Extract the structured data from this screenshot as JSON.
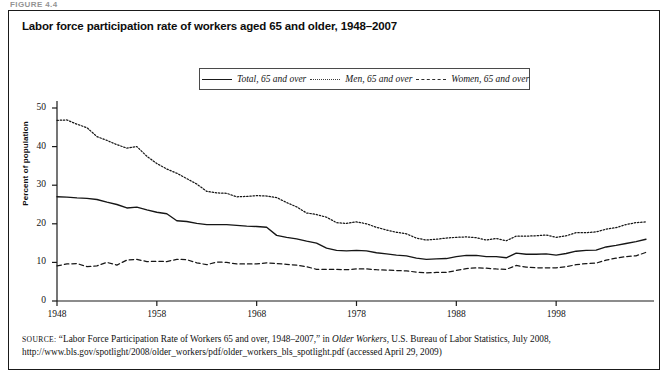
{
  "figure": {
    "label": "FIGURE 4.4",
    "title": "Labor force participation rate of workers aged 65 and older, 1948–2007"
  },
  "legend": {
    "position": "top-center",
    "items": [
      {
        "label": "Total, 65 and over",
        "style": "solid"
      },
      {
        "label": "Men, 65 and over",
        "style": "dotted"
      },
      {
        "label": "Women, 65 and over",
        "style": "dashed"
      }
    ]
  },
  "axes": {
    "ylabel": "Percent of population",
    "yticks": [
      "0",
      "10",
      "20",
      "30",
      "40",
      "50"
    ],
    "xticks": [
      "1948",
      "1958",
      "1968",
      "1978",
      "1988",
      "1998"
    ]
  },
  "source": {
    "kicker": "Source:",
    "text_before_italic": " “Labor Force Participation Rate of Workers 65 and over, 1948–2007,” in ",
    "italic_title": "Older Workers",
    "text_after_italic": ", U.S. Bureau of Labor Statistics, July 2008, http://www.bls.gov/spotlight/2008/older_workers/pdf/older_workers_bls_spotlight.pdf (accessed April 29, 2009)"
  },
  "chart_data": {
    "type": "line",
    "title": "Labor force participation rate of workers aged 65 and older, 1948–2007",
    "xlabel": "",
    "ylabel": "Percent of population",
    "xlim": [
      1948,
      2007
    ],
    "ylim": [
      0,
      50
    ],
    "grid": false,
    "legend_position": "top-center",
    "x": [
      1948,
      1949,
      1950,
      1951,
      1952,
      1953,
      1954,
      1955,
      1956,
      1957,
      1958,
      1959,
      1960,
      1961,
      1962,
      1963,
      1964,
      1965,
      1966,
      1967,
      1968,
      1969,
      1970,
      1971,
      1972,
      1973,
      1974,
      1975,
      1976,
      1977,
      1978,
      1979,
      1980,
      1981,
      1982,
      1983,
      1984,
      1985,
      1986,
      1987,
      1988,
      1989,
      1990,
      1991,
      1992,
      1993,
      1994,
      1995,
      1996,
      1997,
      1998,
      1999,
      2000,
      2001,
      2002,
      2003,
      2004,
      2005,
      2006,
      2007
    ],
    "series": [
      {
        "name": "Total, 65 and over",
        "style": "solid",
        "values": [
          27.0,
          26.9,
          26.7,
          26.6,
          26.3,
          25.6,
          25.0,
          24.1,
          24.3,
          23.6,
          23.0,
          22.6,
          20.8,
          20.6,
          20.1,
          19.8,
          19.8,
          19.8,
          19.6,
          19.4,
          19.3,
          19.1,
          17.0,
          16.5,
          16.1,
          15.5,
          15.0,
          13.7,
          13.1,
          13.0,
          13.1,
          13.0,
          12.5,
          12.2,
          11.9,
          11.7,
          11.1,
          10.8,
          10.9,
          11.0,
          11.5,
          11.8,
          11.8,
          11.5,
          11.5,
          11.2,
          12.4,
          12.1,
          12.1,
          12.2,
          11.9,
          12.3,
          12.9,
          13.1,
          13.2,
          14.0,
          14.4,
          14.9,
          15.4,
          16.0
        ]
      },
      {
        "name": "Men, 65 and over",
        "style": "dotted",
        "values": [
          46.8,
          46.9,
          45.8,
          44.9,
          42.6,
          41.6,
          40.5,
          39.6,
          40.0,
          37.5,
          35.6,
          34.2,
          33.1,
          31.7,
          30.3,
          28.4,
          28.0,
          27.9,
          27.0,
          27.1,
          27.3,
          27.2,
          26.8,
          25.5,
          24.4,
          22.8,
          22.4,
          21.7,
          20.3,
          20.1,
          20.5,
          20.0,
          19.1,
          18.4,
          17.8,
          17.4,
          16.3,
          15.8,
          16.0,
          16.3,
          16.5,
          16.6,
          16.4,
          15.8,
          16.2,
          15.6,
          16.8,
          16.8,
          16.9,
          17.1,
          16.5,
          16.9,
          17.7,
          17.7,
          17.9,
          18.6,
          19.0,
          19.8,
          20.3,
          20.5
        ]
      },
      {
        "name": "Women, 65 and over",
        "style": "dashed",
        "values": [
          9.1,
          9.6,
          9.7,
          8.9,
          9.1,
          10.0,
          9.3,
          10.6,
          10.8,
          10.2,
          10.3,
          10.2,
          10.8,
          10.7,
          9.9,
          9.4,
          10.1,
          10.0,
          9.6,
          9.6,
          9.6,
          9.9,
          9.7,
          9.5,
          9.3,
          8.9,
          8.2,
          8.2,
          8.2,
          8.1,
          8.3,
          8.3,
          8.1,
          8.0,
          7.9,
          7.8,
          7.5,
          7.3,
          7.4,
          7.4,
          7.9,
          8.4,
          8.6,
          8.5,
          8.3,
          8.2,
          9.2,
          8.8,
          8.6,
          8.6,
          8.6,
          8.9,
          9.4,
          9.7,
          9.8,
          10.6,
          11.1,
          11.5,
          11.7,
          12.6
        ]
      }
    ]
  }
}
